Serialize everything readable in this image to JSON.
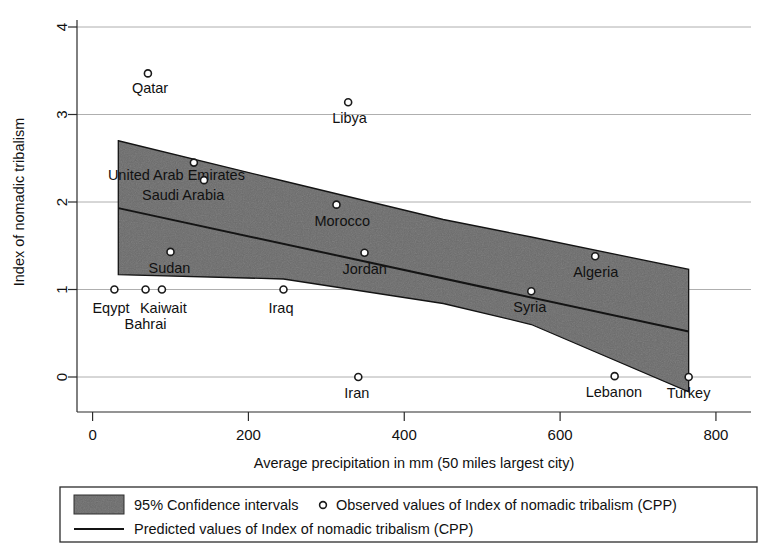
{
  "chart_data": {
    "type": "scatter",
    "title": "",
    "xlabel": "Average precipitation in mm (50 miles largest city)",
    "ylabel": "Index of nomadic tribalism",
    "xlim": [
      -20,
      845
    ],
    "ylim": [
      -0.42,
      4.25
    ],
    "xticks": [
      0,
      200,
      400,
      600,
      800
    ],
    "xtick_labels": [
      "0",
      "200",
      "400",
      "600",
      "800"
    ],
    "yticks": [
      0,
      1,
      2,
      3,
      4
    ],
    "ytick_labels": [
      "0",
      "1",
      "2",
      "3",
      "4"
    ],
    "grid": "horizontal",
    "legend_position": "below-axes",
    "points": [
      {
        "label": "Qatar",
        "x": 71,
        "y": 3.47,
        "label_dx": -16,
        "label_dy": 20
      },
      {
        "label": "Libya",
        "x": 328,
        "y": 3.14,
        "label_dx": -16,
        "label_dy": 21
      },
      {
        "label": "United Arab Emirates",
        "x": 130,
        "y": 2.45,
        "label_dx": -86,
        "label_dy": 17
      },
      {
        "label": "Saudi Arabia",
        "x": 143,
        "y": 2.25,
        "label_dx": -62,
        "label_dy": 20
      },
      {
        "label": "Morocco",
        "x": 313,
        "y": 1.97,
        "label_dx": -22,
        "label_dy": 21
      },
      {
        "label": "Sudan",
        "x": 100,
        "y": 1.43,
        "label_dx": -22,
        "label_dy": 21
      },
      {
        "label": "Jordan",
        "x": 349,
        "y": 1.42,
        "label_dx": -22,
        "label_dy": 21
      },
      {
        "label": "Algeria",
        "x": 645,
        "y": 1.38,
        "label_dx": -22,
        "label_dy": 21
      },
      {
        "label": "Eqypt",
        "x": 28,
        "y": 1.0,
        "label_dx": -22,
        "label_dy": 23
      },
      {
        "label": "Bahrai",
        "x": 68,
        "y": 1.0,
        "label_dx": -21,
        "label_dy": 39
      },
      {
        "label": "Kaiwait",
        "x": 89,
        "y": 1.0,
        "label_dx": -22,
        "label_dy": 23
      },
      {
        "label": "Iraq",
        "x": 245,
        "y": 1.0,
        "label_dx": -15,
        "label_dy": 23
      },
      {
        "label": "Syria",
        "x": 563,
        "y": 0.98,
        "label_dx": -18,
        "label_dy": 21
      },
      {
        "label": "Iran",
        "x": 341,
        "y": 0.0,
        "label_dx": -14,
        "label_dy": 21
      },
      {
        "label": "Lebanon",
        "x": 670,
        "y": 0.01,
        "label_dx": -29,
        "label_dy": 21
      },
      {
        "label": "Turkey",
        "x": 765,
        "y": 0.0,
        "label_dx": -22,
        "label_dy": 21
      }
    ],
    "fit_line": {
      "name": "Predicted values of Index of nomadic tribalism (CPP)",
      "x": [
        33,
        765
      ],
      "y": [
        1.93,
        0.52
      ]
    },
    "confidence_band": {
      "name": "95% Confidence intervals",
      "level": "95%",
      "x": [
        33,
        245,
        450,
        563,
        765
      ],
      "upper": [
        2.7,
        2.24,
        1.8,
        1.6,
        1.23
      ],
      "lower": [
        1.17,
        1.12,
        0.84,
        0.6,
        -0.17
      ],
      "color": "#6a6a6a"
    }
  },
  "legend": {
    "ci_label": "95% Confidence intervals",
    "observed_label": "Observed values of Index of nomadic tribalism (CPP)",
    "predicted_label": "Predicted values of Index of nomadic tribalism (CPP)",
    "marker_icon": "open-circle-marker",
    "swatch_icon": "gray-band-swatch",
    "line_icon": "solid-line-swatch"
  },
  "colors": {
    "band": "#6a6a6a",
    "line": "#141414",
    "axis": "#2b2b2b",
    "grid": "#9a9a9a",
    "text": "#111111"
  }
}
